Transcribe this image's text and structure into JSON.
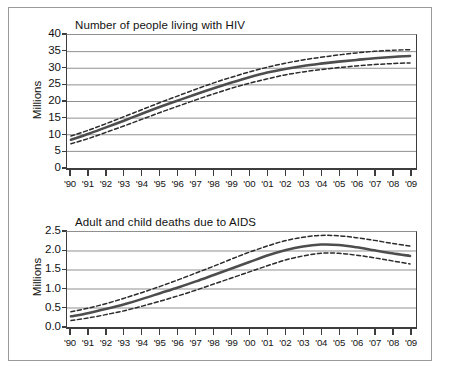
{
  "figure": {
    "panels": [
      "hiv",
      "aids"
    ]
  },
  "chart_data": [
    {
      "id": "hiv",
      "type": "line",
      "title": "Number of people living with HIV",
      "xlabel": "",
      "ylabel": "Millions",
      "grid": true,
      "legend": "none",
      "x": [
        "'90",
        "'91",
        "'92",
        "'93",
        "'94",
        "'95",
        "'96",
        "'97",
        "'98",
        "'99",
        "'00",
        "'01",
        "'02",
        "'03",
        "'04",
        "'05",
        "'06",
        "'07",
        "'08",
        "'09"
      ],
      "xlim": [
        0,
        19
      ],
      "ylim": [
        0,
        40
      ],
      "yticks": [
        0,
        5,
        10,
        15,
        20,
        25,
        30,
        35,
        40
      ],
      "ytick_labels": [
        "0",
        "5",
        "10",
        "15",
        "20",
        "25",
        "30",
        "35",
        "40"
      ],
      "series": [
        {
          "name": "Estimate",
          "style": "solid",
          "color": "#4d4d4d",
          "values": [
            8.5,
            10.3,
            12.3,
            14.3,
            16.4,
            18.4,
            20.3,
            22.2,
            24.0,
            25.7,
            27.3,
            28.7,
            29.8,
            30.7,
            31.4,
            32.0,
            32.5,
            33.0,
            33.4,
            33.7
          ]
        },
        {
          "name": "Upper bound",
          "style": "dashed",
          "color": "#2b2b2b",
          "values": [
            9.6,
            11.4,
            13.4,
            15.5,
            17.6,
            19.7,
            21.7,
            23.7,
            25.6,
            27.3,
            28.9,
            30.3,
            31.5,
            32.5,
            33.3,
            34.0,
            34.6,
            35.1,
            35.4,
            35.6
          ]
        },
        {
          "name": "Lower bound",
          "style": "dashed",
          "color": "#2b2b2b",
          "values": [
            7.3,
            8.9,
            10.8,
            12.7,
            14.7,
            16.7,
            18.6,
            20.5,
            22.3,
            24.0,
            25.5,
            26.8,
            28.0,
            28.9,
            29.6,
            30.2,
            30.7,
            31.1,
            31.4,
            31.6
          ]
        }
      ]
    },
    {
      "id": "aids",
      "type": "line",
      "title": "Adult and child deaths due to AIDS",
      "xlabel": "",
      "ylabel": "Millions",
      "grid": true,
      "legend": "none",
      "x": [
        "'90",
        "'91",
        "'92",
        "'93",
        "'94",
        "'95",
        "'96",
        "'97",
        "'98",
        "'99",
        "'00",
        "'01",
        "'02",
        "'03",
        "'04",
        "'05",
        "'06",
        "'07",
        "'08",
        "'09"
      ],
      "xlim": [
        0,
        19
      ],
      "ylim": [
        0.0,
        2.5
      ],
      "yticks": [
        0.0,
        0.5,
        1.0,
        1.5,
        2.0,
        2.5
      ],
      "ytick_labels": [
        "0.0",
        "0.5",
        "1.0",
        "1.5",
        "2.0",
        "2.5"
      ],
      "series": [
        {
          "name": "Estimate",
          "style": "solid",
          "color": "#4d4d4d",
          "values": [
            0.28,
            0.37,
            0.48,
            0.6,
            0.74,
            0.89,
            1.04,
            1.2,
            1.37,
            1.54,
            1.71,
            1.88,
            2.02,
            2.12,
            2.17,
            2.16,
            2.1,
            2.02,
            1.94,
            1.87
          ]
        },
        {
          "name": "Upper bound",
          "style": "dashed",
          "color": "#2b2b2b",
          "values": [
            0.4,
            0.5,
            0.62,
            0.76,
            0.91,
            1.07,
            1.24,
            1.42,
            1.6,
            1.79,
            1.97,
            2.13,
            2.27,
            2.36,
            2.41,
            2.4,
            2.35,
            2.28,
            2.2,
            2.13
          ]
        },
        {
          "name": "Lower bound",
          "style": "dashed",
          "color": "#2b2b2b",
          "values": [
            0.17,
            0.24,
            0.33,
            0.43,
            0.55,
            0.68,
            0.82,
            0.97,
            1.13,
            1.29,
            1.45,
            1.61,
            1.76,
            1.87,
            1.94,
            1.94,
            1.89,
            1.82,
            1.74,
            1.66
          ]
        }
      ]
    }
  ]
}
